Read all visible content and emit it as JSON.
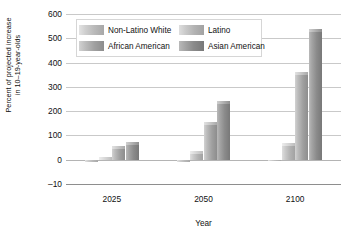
{
  "chart_data": {
    "type": "bar",
    "title": "",
    "subtitle": "",
    "xlabel": "Year",
    "ylabel": "Percent of projected increase in 10–19-year-olds",
    "ylabel_line1": "Percent of projected increase",
    "ylabel_line2": "in 10–19-year-olds",
    "categories": [
      "2025",
      "2050",
      "2100"
    ],
    "series": [
      {
        "name": "Non-Latino White",
        "values": [
          -8,
          -10,
          -5
        ]
      },
      {
        "name": "Latino",
        "values": [
          12,
          35,
          70
        ]
      },
      {
        "name": "African American",
        "values": [
          55,
          155,
          360
        ]
      },
      {
        "name": "Asian American",
        "values": [
          75,
          240,
          540
        ]
      }
    ],
    "ylim": [
      -10,
      600
    ],
    "yticks": [
      600,
      500,
      400,
      300,
      200,
      100,
      0,
      -10
    ],
    "ytick_labels": [
      "600",
      "500",
      "400",
      "300",
      "200",
      "100",
      "0",
      "–10"
    ],
    "grid": true,
    "legend_position": "inside-top-left",
    "colors": {
      "series0": "#c4c4c4",
      "series1": "#bfbfbf",
      "series2": "#ababab",
      "series3": "#8f8f8f",
      "background": "#ffffff",
      "gridline": "#c9c9c9",
      "text": "#111111"
    }
  },
  "legend": {
    "items": [
      {
        "label": "Non-Latino White"
      },
      {
        "label": "Latino"
      },
      {
        "label": "African American"
      },
      {
        "label": "Asian American"
      }
    ]
  },
  "axes": {
    "x_title": "Year",
    "y_title_line1": "Percent of projected increase",
    "y_title_line2": "in 10–19-year-olds",
    "x_tick_labels": [
      "2025",
      "2050",
      "2100"
    ],
    "y_tick_labels": [
      "600",
      "500",
      "400",
      "300",
      "200",
      "100",
      "0",
      "–10"
    ]
  }
}
